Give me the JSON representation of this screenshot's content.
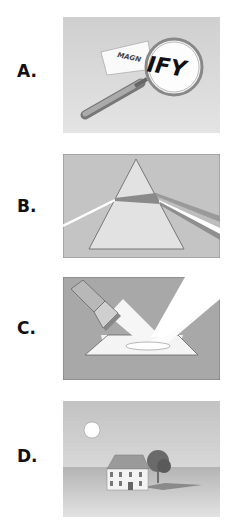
{
  "options": [
    {
      "label": "A.",
      "scene": "magnifying glass enlarging text",
      "paper_text": "MAGN",
      "lens_text": "IFY"
    },
    {
      "label": "B.",
      "scene": "prism dispersing white light into spectrum"
    },
    {
      "label": "C.",
      "scene": "flashlight beam reflecting off a mirror"
    },
    {
      "label": "D.",
      "scene": "sun shining on house and tree casting shadows"
    }
  ],
  "colors": {
    "panel_bg": "#c9c9c9",
    "panel_dark": "#a9a9a9",
    "light": "#ffffff",
    "label": "#111111"
  }
}
